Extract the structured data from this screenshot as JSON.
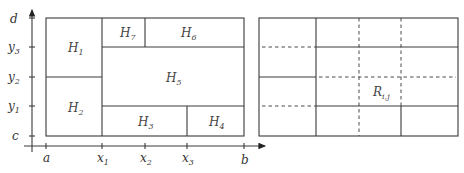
{
  "left_panel": {
    "y_axis_labels": [
      {
        "base": "d",
        "sub": ""
      },
      {
        "base": "y",
        "sub": "3"
      },
      {
        "base": "y",
        "sub": "2"
      },
      {
        "base": "y",
        "sub": "1"
      },
      {
        "base": "c",
        "sub": ""
      }
    ],
    "x_axis_labels": [
      {
        "base": "a",
        "sub": ""
      },
      {
        "base": "x",
        "sub": "1"
      },
      {
        "base": "x",
        "sub": "2"
      },
      {
        "base": "x",
        "sub": "3"
      },
      {
        "base": "b",
        "sub": ""
      }
    ],
    "regions": [
      {
        "base": "H",
        "sub": "1"
      },
      {
        "base": "H",
        "sub": "2"
      },
      {
        "base": "H",
        "sub": "3"
      },
      {
        "base": "H",
        "sub": "4"
      },
      {
        "base": "H",
        "sub": "5"
      },
      {
        "base": "H",
        "sub": "6"
      },
      {
        "base": "H",
        "sub": "7"
      }
    ]
  },
  "right_panel": {
    "cell_label": {
      "base": "R",
      "sub": "i,j"
    }
  }
}
